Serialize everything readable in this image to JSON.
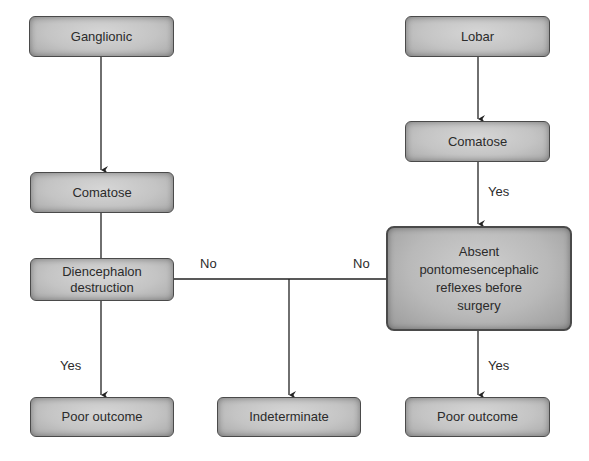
{
  "diagram": {
    "type": "flowchart",
    "nodes": {
      "ganglionic": "Ganglionic",
      "comatose_left": "Comatose",
      "diencephalon_line1": "Diencephalon",
      "diencephalon_line2": "destruction",
      "poor_outcome_left": "Poor outcome",
      "indeterminate": "Indeterminate",
      "lobar": "Lobar",
      "comatose_right": "Comatose",
      "absent_line1": "Absent",
      "absent_line2": "pontomesencephalic",
      "absent_line3": "reflexes before",
      "absent_line4": "surgery",
      "poor_outcome_right": "Poor outcome"
    },
    "edge_labels": {
      "diencephalon_no": "No",
      "absent_no": "No",
      "diencephalon_yes": "Yes",
      "comatose_right_yes": "Yes",
      "absent_yes": "Yes"
    },
    "edges": [
      {
        "from": "Ganglionic",
        "to": "Comatose (left)",
        "label": ""
      },
      {
        "from": "Comatose (left)",
        "to": "Diencephalon destruction",
        "label": ""
      },
      {
        "from": "Diencephalon destruction",
        "to": "Poor outcome (left)",
        "label": "Yes"
      },
      {
        "from": "Diencephalon destruction",
        "to": "Indeterminate",
        "label": "No"
      },
      {
        "from": "Lobar",
        "to": "Comatose (right)",
        "label": ""
      },
      {
        "from": "Comatose (right)",
        "to": "Absent pontomesencephalic reflexes before surgery",
        "label": "Yes"
      },
      {
        "from": "Absent pontomesencephalic reflexes before surgery",
        "to": "Poor outcome (right)",
        "label": "Yes"
      },
      {
        "from": "Absent pontomesencephalic reflexes before surgery",
        "to": "Indeterminate",
        "label": "No"
      }
    ],
    "colors": {
      "box_fill": "#c4c4c4",
      "box_border": "#4a4a4a",
      "line": "#222222",
      "text": "#2b2b2b"
    }
  }
}
